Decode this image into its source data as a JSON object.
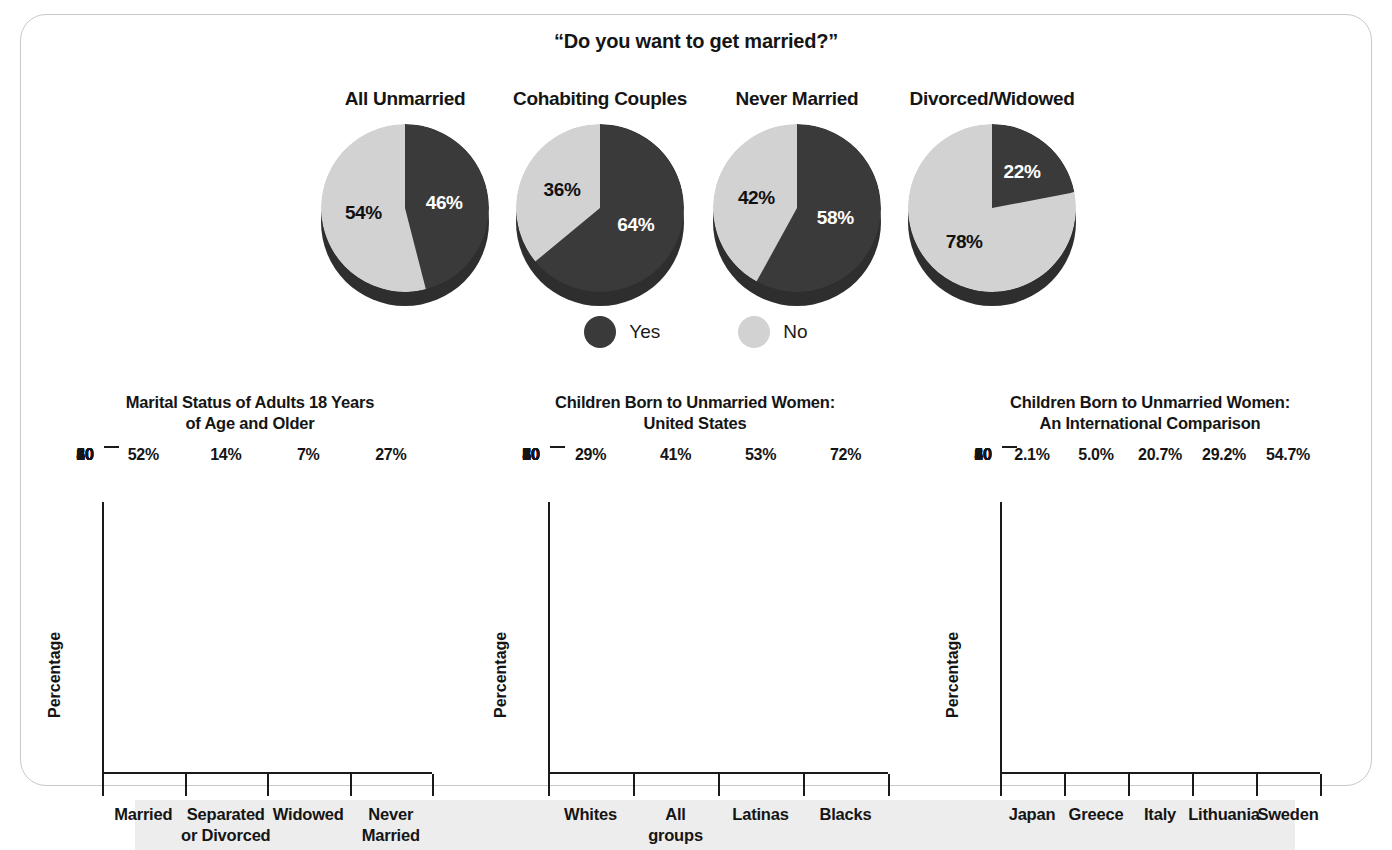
{
  "pie_section": {
    "title": "“Do you want to get married?”",
    "legend": [
      {
        "label": "Yes",
        "color": "#3a3a3a"
      },
      {
        "label": "No",
        "color": "#d2d2d2"
      }
    ],
    "charts": [
      {
        "label": "All Unmarried",
        "yes": 46,
        "no": 54,
        "yes_text": "46%",
        "no_text": "54%"
      },
      {
        "label": "Cohabiting Couples",
        "yes": 64,
        "no": 36,
        "yes_text": "64%",
        "no_text": "36%"
      },
      {
        "label": "Never Married",
        "yes": 58,
        "no": 42,
        "yes_text": "58%",
        "no_text": "42%"
      },
      {
        "label": "Divorced/Widowed",
        "yes": 22,
        "no": 78,
        "yes_text": "22%",
        "no_text": "78%"
      }
    ]
  },
  "bar_charts": [
    {
      "title_line1": "Marital Status of Adults 18 Years",
      "title_line2": "of Age and Older",
      "ylabel": "Percentage",
      "yticks": [
        "60",
        "50",
        "40",
        "30",
        "20",
        "10",
        "0"
      ],
      "categories": [
        "Married",
        "Separated\nor Divorced",
        "Widowed",
        "Never\nMarried"
      ],
      "values": [
        52,
        14,
        7,
        27
      ],
      "value_labels": [
        "52%",
        "14%",
        "7%",
        "27%"
      ]
    },
    {
      "title_line1": "Children Born to Unmarried Women:",
      "title_line2": "United States",
      "ylabel": "Percentage",
      "yticks": [
        "80",
        "70",
        "60",
        "50",
        "40",
        "30",
        "20",
        "10",
        "0"
      ],
      "categories": [
        "Whites",
        "All\ngroups",
        "Latinas",
        "Blacks"
      ],
      "values": [
        29,
        41,
        53,
        72
      ],
      "value_labels": [
        "29%",
        "41%",
        "53%",
        "72%"
      ]
    },
    {
      "title_line1": "Children Born to Unmarried Women:",
      "title_line2": "An International Comparison",
      "ylabel": "Percentage",
      "yticks": [
        "60",
        "50",
        "40",
        "30",
        "20",
        "10",
        "0"
      ],
      "categories": [
        "Japan",
        "Greece",
        "Italy",
        "Lithuania",
        "Sweden"
      ],
      "values": [
        2.1,
        5.0,
        20.7,
        29.2,
        54.7
      ],
      "value_labels": [
        "2.1%",
        "5.0%",
        "20.7%",
        "29.2%",
        "54.7%"
      ]
    }
  ],
  "chart_data": [
    {
      "type": "pie",
      "title": "“Do you want to get married?” — All Unmarried",
      "labels": [
        "Yes",
        "No"
      ],
      "values": [
        46,
        54
      ],
      "colors": [
        "#3a3a3a",
        "#d2d2d2"
      ],
      "legend_position": "bottom"
    },
    {
      "type": "pie",
      "title": "“Do you want to get married?” — Cohabiting Couples",
      "labels": [
        "Yes",
        "No"
      ],
      "values": [
        64,
        36
      ],
      "colors": [
        "#3a3a3a",
        "#d2d2d2"
      ],
      "legend_position": "bottom"
    },
    {
      "type": "pie",
      "title": "“Do you want to get married?” — Never Married",
      "labels": [
        "Yes",
        "No"
      ],
      "values": [
        58,
        42
      ],
      "colors": [
        "#3a3a3a",
        "#d2d2d2"
      ],
      "legend_position": "bottom"
    },
    {
      "type": "pie",
      "title": "“Do you want to get married?” — Divorced/Widowed",
      "labels": [
        "Yes",
        "No"
      ],
      "values": [
        22,
        78
      ],
      "colors": [
        "#3a3a3a",
        "#d2d2d2"
      ],
      "legend_position": "bottom"
    },
    {
      "type": "bar",
      "title": "Marital Status of Adults 18 Years of Age and Older",
      "categories": [
        "Married",
        "Separated or Divorced",
        "Widowed",
        "Never Married"
      ],
      "values": [
        52,
        14,
        7,
        27
      ],
      "xlabel": "",
      "ylabel": "Percentage",
      "ylim": [
        0,
        60
      ],
      "ytick_step": 10,
      "grid": false,
      "bar_color": "#4f4f4f"
    },
    {
      "type": "bar",
      "title": "Children Born to Unmarried Women: United States",
      "categories": [
        "Whites",
        "All groups",
        "Latinas",
        "Blacks"
      ],
      "values": [
        29,
        41,
        53,
        72
      ],
      "xlabel": "",
      "ylabel": "Percentage",
      "ylim": [
        0,
        80
      ],
      "ytick_step": 10,
      "grid": false,
      "bar_color": "#4f4f4f"
    },
    {
      "type": "bar",
      "title": "Children Born to Unmarried Women: An International Comparison",
      "categories": [
        "Japan",
        "Greece",
        "Italy",
        "Lithuania",
        "Sweden"
      ],
      "values": [
        2.1,
        5.0,
        20.7,
        29.2,
        54.7
      ],
      "xlabel": "",
      "ylabel": "Percentage",
      "ylim": [
        0,
        60
      ],
      "ytick_step": 10,
      "grid": false,
      "bar_color": "#4f4f4f"
    }
  ]
}
